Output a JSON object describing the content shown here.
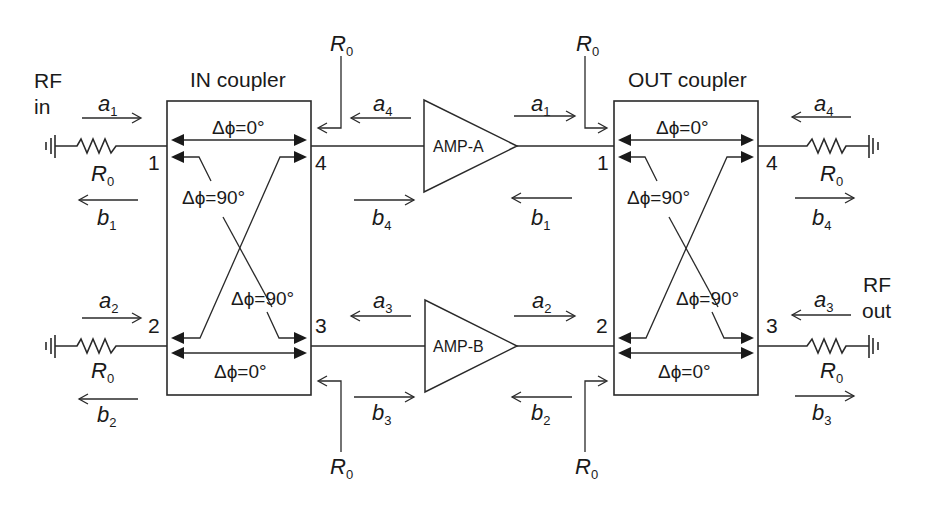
{
  "labels": {
    "rf_in_line1": "RF",
    "rf_in_line2": "in",
    "rf_out_line1": "RF",
    "rf_out_line2": "out",
    "in_coupler": "IN coupler",
    "out_coupler": "OUT coupler",
    "amp_a": "AMP-A",
    "amp_b": "AMP-B"
  },
  "resistor": {
    "symbol": "R",
    "subscript": "0"
  },
  "phases": {
    "zero": "Δϕ=0°",
    "ninety": "Δϕ=90°"
  },
  "couplers": [
    {
      "name": "IN coupler",
      "ports": {
        "p1": "1",
        "p2": "2",
        "p3": "3",
        "p4": "4"
      }
    },
    {
      "name": "OUT coupler",
      "ports": {
        "p1": "1",
        "p2": "2",
        "p3": "3",
        "p4": "4"
      }
    }
  ],
  "waves": {
    "in_left": {
      "a1": {
        "sym": "a",
        "sub": "1"
      },
      "b1": {
        "sym": "b",
        "sub": "1"
      },
      "a2": {
        "sym": "a",
        "sub": "2"
      },
      "b2": {
        "sym": "b",
        "sub": "2"
      }
    },
    "in_right": {
      "a4": {
        "sym": "a",
        "sub": "4"
      },
      "b4": {
        "sym": "b",
        "sub": "4"
      },
      "a3": {
        "sym": "a",
        "sub": "3"
      },
      "b3": {
        "sym": "b",
        "sub": "3"
      }
    },
    "out_left": {
      "a1": {
        "sym": "a",
        "sub": "1"
      },
      "b1": {
        "sym": "b",
        "sub": "1"
      },
      "a2": {
        "sym": "a",
        "sub": "2"
      },
      "b2": {
        "sym": "b",
        "sub": "2"
      }
    },
    "out_right": {
      "a4": {
        "sym": "a",
        "sub": "4"
      },
      "b4": {
        "sym": "b",
        "sub": "4"
      },
      "a3": {
        "sym": "a",
        "sub": "3"
      },
      "b3": {
        "sym": "b",
        "sub": "3"
      }
    }
  },
  "colors": {
    "line": "#2a2a2a",
    "text": "#1a1a1a",
    "background": "#ffffff"
  }
}
